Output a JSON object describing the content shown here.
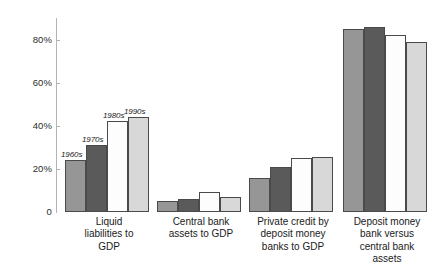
{
  "chart_data": {
    "type": "bar",
    "title": "",
    "subtitle": "",
    "xlabel": "",
    "ylabel": "",
    "ylim": [
      0,
      90
    ],
    "grid": false,
    "legend_position": "inline-bar-labels",
    "y_ticks": [
      {
        "value": 0,
        "label": "0"
      },
      {
        "value": 20,
        "label": "20%"
      },
      {
        "value": 40,
        "label": "40%"
      },
      {
        "value": 60,
        "label": "60%"
      },
      {
        "value": 80,
        "label": "80%"
      }
    ],
    "categories": [
      "Liquid\nliabilities to\nGDP",
      "Central bank\nassets to GDP",
      "Private credit by\ndeposit money\nbanks to GDP",
      "Deposit money\nbank versus\ncentral bank\nassets"
    ],
    "series": [
      {
        "name": "1960s",
        "color": "#969696",
        "values": [
          24,
          5,
          16,
          85
        ]
      },
      {
        "name": "1970s",
        "color": "#5a5a5a",
        "values": [
          31,
          6,
          21,
          86
        ]
      },
      {
        "name": "1980s",
        "color": "#fdfdfd",
        "values": [
          42,
          9.5,
          25,
          82
        ]
      },
      {
        "name": "1990s",
        "color": "#d8d8d8",
        "values": [
          44,
          7,
          25.5,
          79
        ]
      }
    ],
    "annotations": [
      {
        "text": "1960s",
        "group": 0,
        "series": 0
      },
      {
        "text": "1970s",
        "group": 0,
        "series": 1
      },
      {
        "text": "1980s",
        "group": 0,
        "series": 2
      },
      {
        "text": "1990s",
        "group": 0,
        "series": 3
      }
    ],
    "bar_border_color": "#4a4a4a",
    "axis_color": "#b4b4b4"
  }
}
